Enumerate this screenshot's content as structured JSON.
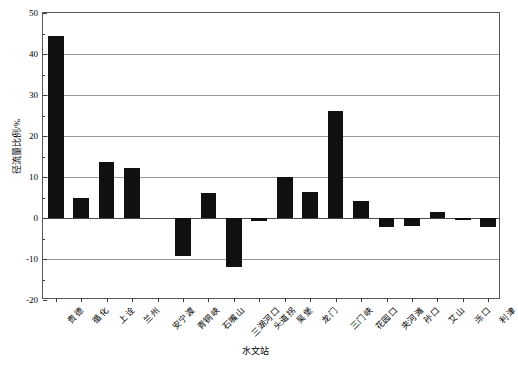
{
  "chart_data": {
    "type": "bar",
    "title": "",
    "subtitle": "",
    "xlabel": "水文站",
    "ylabel": "径流量比例/%",
    "ylim": [
      -20,
      50
    ],
    "ytick_values": [
      -20,
      -10,
      0,
      10,
      20,
      30,
      40,
      50
    ],
    "ytick_labels": [
      "-20",
      "-10",
      "0",
      "10",
      "20",
      "30",
      "40",
      "50"
    ],
    "yminor_step": 5,
    "grid": "horizontal",
    "legend": "none",
    "bar_color": "#101010",
    "categories": [
      "贵德",
      "循化",
      "上诠",
      "兰州",
      "安宁渡",
      "青铜峡",
      "石嘴山",
      "三湖河口",
      "头道拐",
      "吴堡",
      "龙门",
      "三门峡",
      "花园口",
      "夹河滩",
      "孙口",
      "艾山",
      "泺口",
      "利津"
    ],
    "values": [
      44.5,
      4.8,
      13.7,
      12.3,
      0.0,
      -9.3,
      6.0,
      -12.0,
      -0.7,
      10.0,
      6.3,
      26.0,
      4.1,
      -2.2,
      -2.0,
      1.5,
      -0.4,
      -2.2
    ]
  }
}
